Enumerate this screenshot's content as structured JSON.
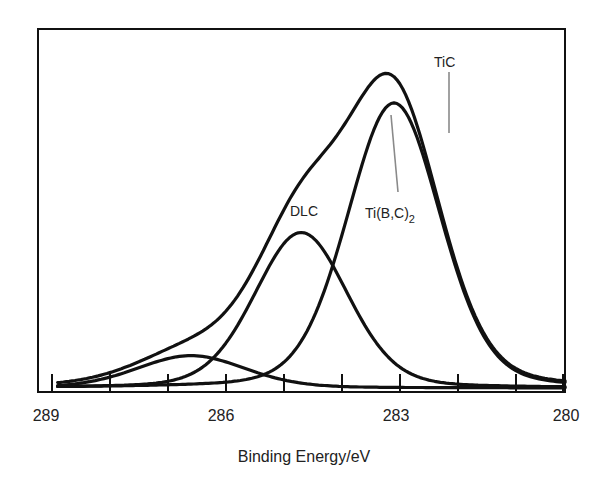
{
  "chart_data": {
    "type": "line",
    "title": "",
    "xlabel": "Binding Energy/eV",
    "ylabel": "",
    "xlim": [
      289,
      280
    ],
    "x_reversed": true,
    "grid": false,
    "legend": "none",
    "x_tick_labels": [
      "289",
      "286",
      "283",
      "280"
    ],
    "x_minor_ticks": [
      289,
      288,
      287,
      286,
      285,
      284,
      283,
      282,
      281,
      280
    ],
    "y_ticks": "none",
    "series": [
      {
        "name": "Envelope (total fit)",
        "peak_x": 283.25,
        "peak_y": 100
      },
      {
        "name": "Ti(B,C)2",
        "peak_x": 283.0,
        "peak_y": 88,
        "fwhm": 1.9
      },
      {
        "name": "DLC",
        "peak_x": 284.6,
        "peak_y": 48,
        "fwhm": 1.9
      },
      {
        "name": "Minor component",
        "peak_x": 286.5,
        "peak_y": 10,
        "fwhm": 2.2
      }
    ],
    "annotations": [
      {
        "text": "TiC",
        "x": 282.2,
        "note": "gray marker line"
      },
      {
        "text": "Ti(B,C)2",
        "x": 283.0,
        "note": "gray leader to Ti(B,C)2 peak"
      },
      {
        "text": "DLC",
        "x": 284.6
      }
    ]
  },
  "labels": {
    "xlabel": "Binding Energy/eV",
    "tic": "TiC",
    "dlc": "DLC",
    "tibc_main": "Ti(B,C)",
    "tibc_sub": "2",
    "ticks": [
      "289",
      "286",
      "283",
      "280"
    ]
  },
  "colors": {
    "curve": "#111111",
    "leader": "#8a8a8a",
    "frame": "#111111",
    "background": "#ffffff"
  }
}
